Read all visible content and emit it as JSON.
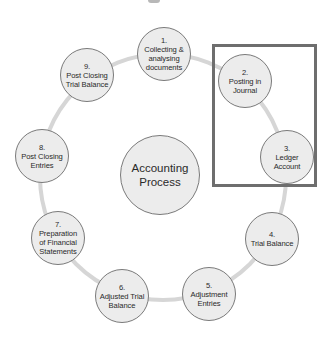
{
  "diagram": {
    "title": "Accounting Process",
    "center": {
      "label": "Accounting\nProcess",
      "x": 160,
      "y": 175,
      "diameter": 80
    },
    "ring": {
      "cx": 163,
      "cy": 177,
      "r": 123,
      "color": "#d6d6d6",
      "width": 4
    },
    "node_diameter": 54,
    "nodes": [
      {
        "number": "1.",
        "label": "Collecting &\nanalysing\ndocuments",
        "x": 164,
        "y": 54
      },
      {
        "number": "2.",
        "label": "Posting in\nJournal",
        "x": 245,
        "y": 81
      },
      {
        "number": "3.",
        "label": "Ledger\nAccount",
        "x": 287,
        "y": 157
      },
      {
        "number": "4.",
        "label": "Trial Balance",
        "x": 272,
        "y": 239
      },
      {
        "number": "5.",
        "label": "Adjustment\nEntries",
        "x": 209,
        "y": 294
      },
      {
        "number": "6.",
        "label": "Adjusted Trial\nBalance",
        "x": 122,
        "y": 296
      },
      {
        "number": "7.",
        "label": "Preparation\nof Financial\nStatements",
        "x": 58,
        "y": 238
      },
      {
        "number": "8.",
        "label": "Post Closing\nEntries",
        "x": 42,
        "y": 156
      },
      {
        "number": "9.",
        "label": "Post Closing\nTrial Balance",
        "x": 87,
        "y": 75
      }
    ],
    "highlight_box": {
      "left": 212,
      "top": 44,
      "right": 317,
      "bottom": 187,
      "color": "#6e6e6e",
      "encloses": [
        "2.",
        "3."
      ]
    },
    "colors": {
      "node_fill": "#ececec",
      "node_border": "#7a7a7a",
      "text": "#2a2a2a"
    }
  }
}
